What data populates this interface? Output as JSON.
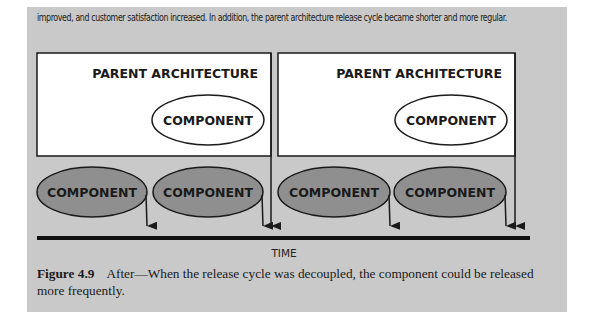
{
  "intro_text": "improved, and customer satisfaction increased. In addition, the parent architecture release cycle became shorter and more regular.",
  "diagram": {
    "parent_boxes": [
      {
        "title": "PARENT ARCHITECTURE",
        "inner_component": "COMPONENT"
      },
      {
        "title": "PARENT ARCHITECTURE",
        "inner_component": "COMPONENT"
      }
    ],
    "released_components": [
      {
        "label": "COMPONENT"
      },
      {
        "label": "COMPONENT"
      },
      {
        "label": "COMPONENT"
      },
      {
        "label": "COMPONENT"
      }
    ],
    "timeline_label": "TIME",
    "colors": {
      "panel_bg": "#c9c9c9",
      "box_fill": "#ffffff",
      "component_fill": "#8f8f8f",
      "stroke": "#1a1a1a"
    }
  },
  "caption": {
    "label": "Figure 4.9",
    "text": "After—When the release cycle was decoupled, the component could be released more frequently."
  }
}
